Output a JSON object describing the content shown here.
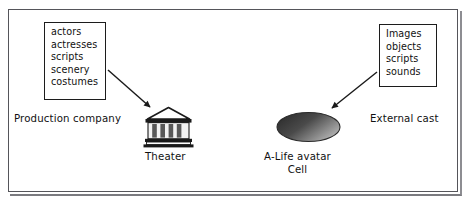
{
  "figure": {
    "caption_present": false,
    "frame_color": "#55555a",
    "background": "#ffffff",
    "ink_color": "#111111"
  },
  "diagram": {
    "type": "concept-diagram",
    "nodes": [
      {
        "id": "production-company",
        "kind": "resource-list-box",
        "label": "Production company",
        "items": [
          "actors",
          "actresses",
          "scripts",
          "scenery",
          "costumes"
        ]
      },
      {
        "id": "theater",
        "kind": "icon-node",
        "icon": "classical-building-icon",
        "label": "Theater"
      },
      {
        "id": "alife-cell",
        "kind": "ellipse-node",
        "label_line1": "A-Life avatar",
        "label_line2": "Cell",
        "fill_dark": "#3a3a3a",
        "fill_light": "#b9b9b9"
      },
      {
        "id": "external-cast",
        "kind": "resource-list-box",
        "label": "External cast",
        "items": [
          "Images",
          "objects",
          "scripts",
          "sounds"
        ]
      }
    ],
    "edges": [
      {
        "id": "edge-production-to-theater",
        "from": "production-company",
        "to": "theater",
        "style": "solid-arrow",
        "direction": "down-right"
      },
      {
        "id": "edge-external-to-cell",
        "from": "external-cast",
        "to": "alife-cell",
        "style": "solid-arrow",
        "direction": "down-left"
      }
    ]
  }
}
